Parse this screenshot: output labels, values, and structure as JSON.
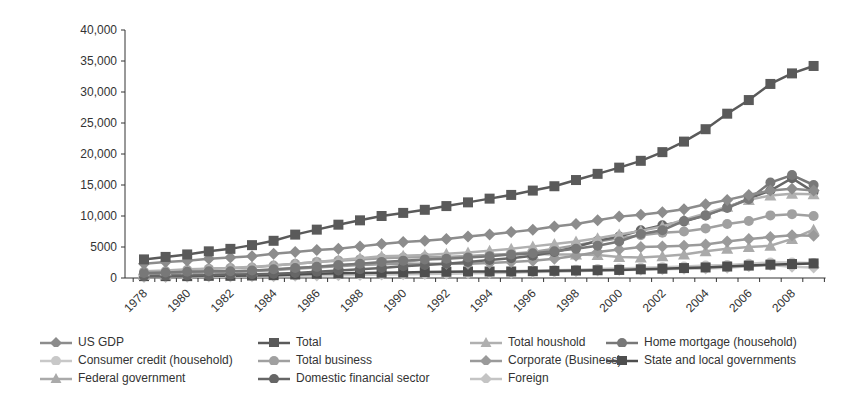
{
  "chart_data": {
    "type": "line",
    "title": "",
    "xlabel": "",
    "ylabel": "",
    "ylim": [
      0,
      40000
    ],
    "yticks": [
      "0",
      "5000",
      "10,000",
      "15,000",
      "20,000",
      "25,000",
      "30,000",
      "35,000",
      "40,000"
    ],
    "xtick_labels": [
      "1978",
      "1980",
      "1982",
      "1984",
      "1986",
      "1988",
      "1990",
      "1992",
      "1994",
      "1996",
      "1998",
      "2000",
      "2002",
      "2004",
      "2006",
      "2008"
    ],
    "x": [
      1978,
      1979,
      1980,
      1981,
      1982,
      1983,
      1984,
      1985,
      1986,
      1987,
      1988,
      1989,
      1990,
      1991,
      1992,
      1993,
      1994,
      1995,
      1996,
      1997,
      1998,
      1999,
      2000,
      2001,
      2002,
      2003,
      2004,
      2005,
      2006,
      2007,
      2008,
      2009
    ],
    "grid": false,
    "legend_position": "bottom",
    "series": [
      {
        "name": "US GDP",
        "marker": "diamond",
        "color": "#8c8c8c",
        "values": [
          2300,
          2600,
          2800,
          3100,
          3300,
          3500,
          3900,
          4200,
          4500,
          4700,
          5100,
          5500,
          5800,
          6000,
          6300,
          6700,
          7000,
          7400,
          7800,
          8300,
          8700,
          9300,
          9900,
          10200,
          10600,
          11100,
          11900,
          12600,
          13400,
          14100,
          14400,
          14100
        ]
      },
      {
        "name": "Total",
        "marker": "square",
        "color": "#5a5a5a",
        "values": [
          3000,
          3400,
          3800,
          4300,
          4700,
          5300,
          6000,
          7000,
          7800,
          8600,
          9300,
          10000,
          10500,
          11000,
          11600,
          12200,
          12800,
          13400,
          14100,
          14800,
          15800,
          16800,
          17800,
          18900,
          20300,
          22000,
          24000,
          26500,
          28700,
          31300,
          33000,
          34200
        ]
      },
      {
        "name": "Total houshold",
        "marker": "triangle",
        "color": "#b0b0b0",
        "values": [
          1100,
          1200,
          1400,
          1500,
          1600,
          1800,
          2000,
          2300,
          2600,
          2900,
          3200,
          3500,
          3600,
          3700,
          3900,
          4100,
          4400,
          4700,
          5100,
          5500,
          5900,
          6400,
          7000,
          7600,
          8300,
          9400,
          10400,
          11500,
          12600,
          13300,
          13600,
          13500
        ]
      },
      {
        "name": "Home mortgage (household)",
        "marker": "circle",
        "color": "#787878",
        "values": [
          800,
          900,
          1000,
          1100,
          1100,
          1200,
          1400,
          1600,
          1800,
          2100,
          2300,
          2600,
          2800,
          3000,
          3100,
          3300,
          3500,
          3800,
          4000,
          4300,
          4700,
          5200,
          5900,
          7100,
          7700,
          9200,
          10100,
          11300,
          12700,
          15400,
          16600,
          15000
        ]
      },
      {
        "name": "Consumer credit (household)",
        "marker": "circle",
        "color": "#c8c8c8",
        "values": [
          300,
          350,
          350,
          380,
          400,
          450,
          520,
          600,
          660,
          700,
          740,
          790,
          800,
          800,
          800,
          840,
          960,
          1100,
          1200,
          1260,
          1350,
          1450,
          1550,
          1650,
          1750,
          1850,
          2000,
          2100,
          2300,
          2500,
          2500,
          2400
        ]
      },
      {
        "name": "Total business",
        "marker": "circle",
        "color": "#a0a0a0",
        "values": [
          1000,
          1100,
          1300,
          1500,
          1600,
          1700,
          2000,
          2300,
          2600,
          2800,
          3000,
          3200,
          3300,
          3400,
          3400,
          3500,
          3700,
          3900,
          4200,
          4700,
          5300,
          5900,
          6400,
          6900,
          7300,
          7500,
          8000,
          8700,
          9200,
          10100,
          10300,
          10000
        ]
      },
      {
        "name": "Corporate (Business)",
        "marker": "diamond",
        "color": "#9a9a9a",
        "values": [
          600,
          700,
          800,
          900,
          1000,
          1100,
          1300,
          1500,
          1700,
          1900,
          2100,
          2200,
          2300,
          2300,
          2300,
          2300,
          2400,
          2600,
          2800,
          3100,
          3600,
          4200,
          4600,
          5000,
          5100,
          5200,
          5400,
          5900,
          6300,
          6600,
          6900,
          6800
        ]
      },
      {
        "name": "State and local governments",
        "marker": "square",
        "color": "#4e4e4e",
        "values": [
          300,
          300,
          300,
          350,
          350,
          400,
          460,
          570,
          680,
          750,
          800,
          850,
          900,
          950,
          1000,
          1050,
          1050,
          1050,
          1100,
          1150,
          1200,
          1250,
          1300,
          1400,
          1500,
          1600,
          1700,
          1850,
          2000,
          2150,
          2250,
          2350
        ]
      },
      {
        "name": "Federal government",
        "marker": "triangle",
        "color": "#aaaaaa",
        "values": [
          500,
          550,
          650,
          750,
          900,
          1100,
          1300,
          1600,
          1800,
          2000,
          2200,
          2400,
          2600,
          3000,
          3300,
          3500,
          3700,
          3800,
          3900,
          3800,
          3800,
          3700,
          3400,
          3300,
          3500,
          3800,
          4300,
          4700,
          5000,
          5200,
          6300,
          7800
        ]
      },
      {
        "name": "Domestic financial sector",
        "marker": "circle",
        "color": "#666666",
        "values": [
          300,
          350,
          400,
          450,
          550,
          600,
          700,
          800,
          1000,
          1200,
          1400,
          1600,
          1900,
          2100,
          2300,
          2600,
          2900,
          3200,
          3600,
          4200,
          5000,
          6000,
          6700,
          7700,
          8500,
          9100,
          10100,
          11400,
          12800,
          14100,
          16100,
          13900
        ]
      },
      {
        "name": "Foreign",
        "marker": "diamond",
        "color": "#c4c4c4",
        "values": [
          150,
          180,
          200,
          230,
          250,
          280,
          300,
          350,
          400,
          450,
          500,
          550,
          600,
          650,
          700,
          750,
          800,
          850,
          950,
          1000,
          1100,
          1200,
          1300,
          1350,
          1400,
          1500,
          1550,
          1650,
          1900,
          2100,
          1800,
          1700
        ]
      }
    ]
  },
  "legend": {
    "items": [
      "US GDP",
      "Total",
      "Total houshold",
      "Home mortgage (household)",
      "Consumer credit (household)",
      "Total business",
      "Corporate (Business)",
      "State and local governments",
      "Federal government",
      "Domestic financial sector",
      "Foreign"
    ]
  }
}
